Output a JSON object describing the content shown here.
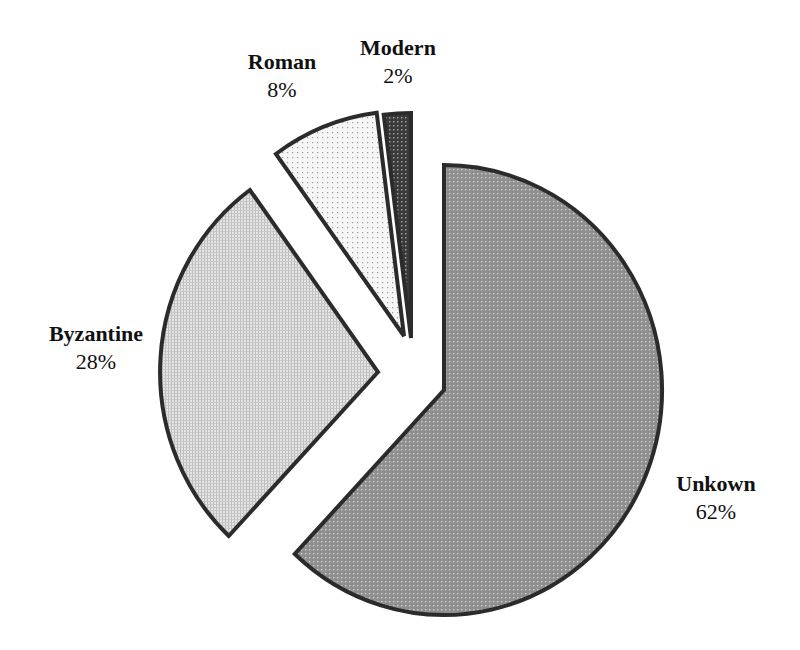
{
  "chart_data": {
    "type": "pie",
    "title": "",
    "exploded": true,
    "categories": [
      "Unkown",
      "Byzantine",
      "Roman",
      "Modern"
    ],
    "values": [
      62,
      28,
      8,
      2
    ],
    "labels": [
      "62%",
      "28%",
      "8%",
      "2%"
    ],
    "start_angle_deg": -90,
    "direction": "clockwise",
    "legend": "none",
    "data_labels": "outside, name + percent"
  },
  "slices": [
    {
      "name": "Unkown",
      "pct_label": "62%",
      "value": 62,
      "fill": "#9a9a9a",
      "pattern": "dense-dots-dark",
      "cx": 444,
      "cy": 390,
      "label_x": 668,
      "label_y": 470,
      "label_w": 96
    },
    {
      "name": "Byzantine",
      "pct_label": "28%",
      "value": 28,
      "fill": "#d6d6d6",
      "pattern": "fine-grid-light",
      "cx": 378,
      "cy": 372,
      "label_x": 38,
      "label_y": 320,
      "label_w": 116
    },
    {
      "name": "Roman",
      "pct_label": "8%",
      "value": 8,
      "fill": "#f2f2f2",
      "pattern": "sparse-dots",
      "cx": 404,
      "cy": 336,
      "label_x": 236,
      "label_y": 48,
      "label_w": 92
    },
    {
      "name": "Modern",
      "pct_label": "2%",
      "value": 2,
      "fill": "#4a4a4a",
      "pattern": "crosshatch-dark",
      "cx": 411,
      "cy": 338,
      "label_x": 348,
      "label_y": 34,
      "label_w": 100
    }
  ],
  "style": {
    "stroke": "#2b2b2b",
    "stroke_width": 4,
    "rx": 218,
    "ry": 225
  }
}
